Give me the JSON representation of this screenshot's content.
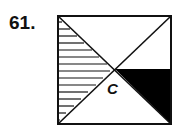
{
  "problem": {
    "number": "61.",
    "figure": {
      "shape": "square",
      "center_label": "C",
      "regions": [
        {
          "name": "left-triangle",
          "fill": "horizontal-hatch"
        },
        {
          "name": "right-lower-triangle",
          "fill": "solid-black"
        },
        {
          "name": "top-triangle",
          "fill": "white"
        },
        {
          "name": "bottom-triangle",
          "fill": "white"
        }
      ],
      "colors": {
        "stroke": "#111111",
        "fill_dark": "#000000",
        "background": "#ffffff"
      }
    }
  }
}
